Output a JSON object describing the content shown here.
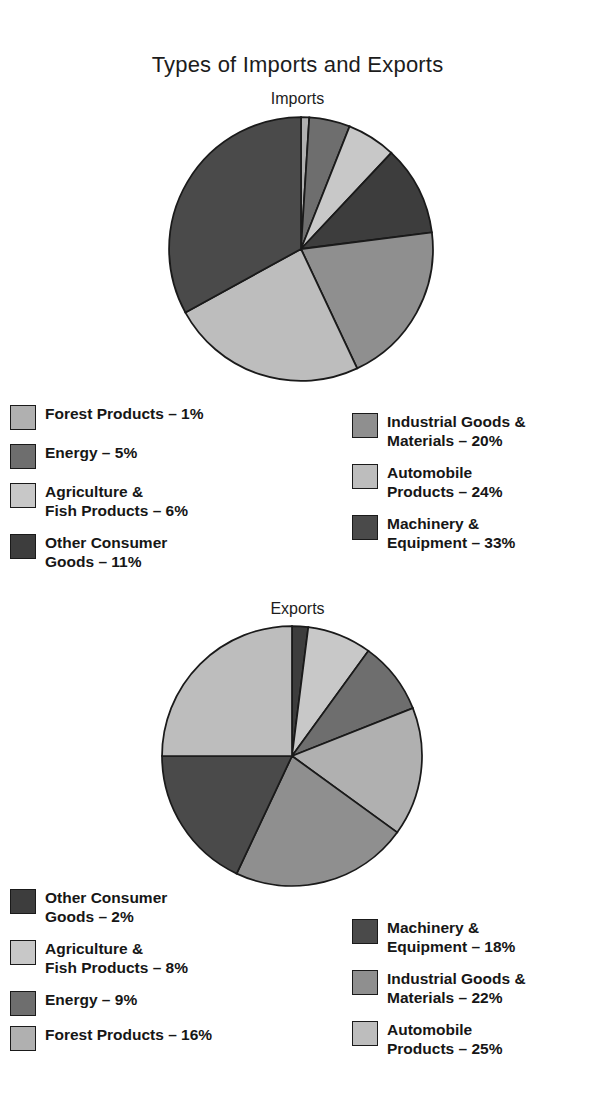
{
  "title": "Types of Imports and Exports",
  "charts": [
    {
      "name": "imports",
      "subtitle": "Imports",
      "legend_left": [
        {
          "label": "Forest Products – 1%",
          "color": "#b0b0b0",
          "swatch_name": "legend-swatch-forest-products"
        },
        {
          "label": "Energy – 5%",
          "color": "#6e6e6e",
          "swatch_name": "legend-swatch-energy"
        },
        {
          "label": "Agriculture &\nFish Products – 6%",
          "color": "#c8c8c8",
          "swatch_name": "legend-swatch-agriculture-fish-products"
        },
        {
          "label": "Other Consumer\nGoods – 11%",
          "color": "#3d3d3d",
          "swatch_name": "legend-swatch-other-consumer-goods"
        }
      ],
      "legend_right": [
        {
          "label": "Industrial Goods &\nMaterials – 20%",
          "color": "#8f8f8f",
          "swatch_name": "legend-swatch-industrial-goods-materials"
        },
        {
          "label": "Automobile\nProducts – 24%",
          "color": "#bdbdbd",
          "swatch_name": "legend-swatch-automobile-products"
        },
        {
          "label": "Machinery &\nEquipment – 33%",
          "color": "#4a4a4a",
          "swatch_name": "legend-swatch-machinery-equipment"
        }
      ]
    },
    {
      "name": "exports",
      "subtitle": "Exports",
      "legend_left": [
        {
          "label": "Other Consumer\nGoods – 2%",
          "color": "#3d3d3d",
          "swatch_name": "legend-swatch-other-consumer-goods"
        },
        {
          "label": "Agriculture &\nFish Products – 8%",
          "color": "#c8c8c8",
          "swatch_name": "legend-swatch-agriculture-fish-products"
        },
        {
          "label": "Energy – 9%",
          "color": "#6e6e6e",
          "swatch_name": "legend-swatch-energy"
        },
        {
          "label": "Forest Products – 16%",
          "color": "#b0b0b0",
          "swatch_name": "legend-swatch-forest-products"
        }
      ],
      "legend_right": [
        {
          "label": "Machinery &\nEquipment – 18%",
          "color": "#4a4a4a",
          "swatch_name": "legend-swatch-machinery-equipment"
        },
        {
          "label": "Industrial Goods &\nMaterials – 22%",
          "color": "#8f8f8f",
          "swatch_name": "legend-swatch-industrial-goods-materials"
        },
        {
          "label": "Automobile\nProducts – 25%",
          "color": "#bdbdbd",
          "swatch_name": "legend-swatch-automobile-products"
        }
      ]
    }
  ],
  "chart_data": [
    {
      "type": "pie",
      "title": "Imports",
      "suptitle": "Types of Imports and Exports",
      "unit": "percent",
      "start_angle_deg": 0,
      "direction": "clockwise",
      "labels": [
        "Forest Products",
        "Energy",
        "Agriculture & Fish Products",
        "Other Consumer Goods",
        "Industrial Goods & Materials",
        "Automobile Products",
        "Machinery & Equipment"
      ],
      "values": [
        1,
        5,
        6,
        11,
        20,
        24,
        33
      ],
      "colors": [
        "#b0b0b0",
        "#6e6e6e",
        "#c8c8c8",
        "#3d3d3d",
        "#8f8f8f",
        "#bdbdbd",
        "#4a4a4a"
      ],
      "legend_position": "below"
    },
    {
      "type": "pie",
      "title": "Exports",
      "suptitle": "Types of Imports and Exports",
      "unit": "percent",
      "start_angle_deg": 0,
      "direction": "clockwise",
      "labels": [
        "Other Consumer Goods",
        "Agriculture & Fish Products",
        "Energy",
        "Forest Products",
        "Industrial Goods & Materials",
        "Machinery & Equipment",
        "Automobile Products"
      ],
      "values": [
        2,
        8,
        9,
        16,
        22,
        18,
        25
      ],
      "colors": [
        "#3d3d3d",
        "#c8c8c8",
        "#6e6e6e",
        "#b0b0b0",
        "#8f8f8f",
        "#4a4a4a",
        "#bdbdbd"
      ],
      "legend_position": "below"
    }
  ]
}
